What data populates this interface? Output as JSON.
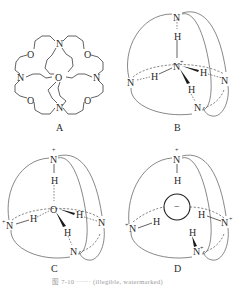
{
  "figure": {
    "panels": [
      {
        "id": "A",
        "label": "A",
        "description": "Spherical cryptand ligand (4 bridgehead N, 6 O)",
        "atoms": {
          "n_top": "N",
          "n_left": "N",
          "n_right": "N",
          "n_bottom": "N",
          "o_center": "O",
          "o_ul": "O",
          "o_ur": "O",
          "o_ll": "O",
          "o_lr": "O"
        }
      },
      {
        "id": "B",
        "label": "B",
        "description": "NH4+ inclusion complex",
        "atoms": {
          "n_top": "N",
          "h_top": "H",
          "n_center": "N",
          "center_charge": "+",
          "h_left": "H",
          "n_left": "N",
          "h_right": "H",
          "n_right": "N",
          "h_bottom": "H",
          "n_bottom": "N"
        }
      },
      {
        "id": "C",
        "label": "C",
        "description": "H2O inclusion in tetraprotonated cryptand",
        "atoms": {
          "n_top": "N",
          "n_top_charge": "+",
          "h_top": "H",
          "o_center": "O",
          "n_left": "N",
          "n_left_charge": "+",
          "h_left": "H",
          "h_right": "H",
          "n_right": "N",
          "h_bottom": "H",
          "n_bottom": "N"
        }
      },
      {
        "id": "D",
        "label": "D",
        "description": "Anion inclusion in tetraprotonated cryptand",
        "atoms": {
          "n_top": "N",
          "n_top_charge": "+",
          "h_top": "H",
          "anion_charge": "−",
          "n_left": "N",
          "n_left_charge": "+",
          "h_left": "H",
          "h_right": "H",
          "n_right": "N",
          "n_right_charge": "+",
          "h_bottom": "H",
          "n_bottom": "N",
          "n_bottom_charge": "+"
        }
      }
    ],
    "caption": "图 7-10 ······ (illegible, watermarked)"
  }
}
